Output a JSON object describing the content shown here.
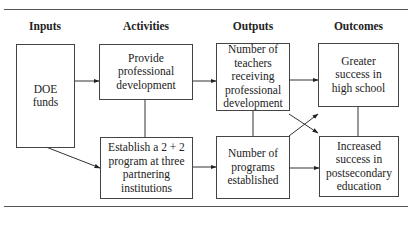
{
  "diagram": {
    "type": "logic-model",
    "columns": [
      {
        "id": "inputs",
        "label": "Inputs"
      },
      {
        "id": "activities",
        "label": "Activities"
      },
      {
        "id": "outputs",
        "label": "Outputs"
      },
      {
        "id": "outcomes",
        "label": "Outcomes"
      }
    ],
    "nodes": {
      "doe_funds": "DOE funds",
      "provide_pd": "Provide professional development",
      "establish_program": "Establish a 2 + 2 program at three partnering institutions",
      "num_teachers": "Number of teachers receiving professional development",
      "num_programs": "Number of programs established",
      "greater_success": "Greater success in high school",
      "increased_success": "Increased success in postsecondary education"
    },
    "edges": [
      {
        "from": "doe_funds",
        "to": "provide_pd",
        "arrow": true
      },
      {
        "from": "doe_funds",
        "to": "establish_program",
        "arrow": true
      },
      {
        "from": "provide_pd",
        "to": "establish_program",
        "arrow": false
      },
      {
        "from": "provide_pd",
        "to": "num_teachers",
        "arrow": true
      },
      {
        "from": "establish_program",
        "to": "num_programs",
        "arrow": true
      },
      {
        "from": "num_teachers",
        "to": "num_programs",
        "arrow": false
      },
      {
        "from": "num_teachers",
        "to": "greater_success",
        "arrow": true
      },
      {
        "from": "num_teachers",
        "to": "increased_success",
        "arrow": true
      },
      {
        "from": "num_programs",
        "to": "greater_success",
        "arrow": true
      },
      {
        "from": "num_programs",
        "to": "increased_success",
        "arrow": true
      },
      {
        "from": "greater_success",
        "to": "increased_success",
        "arrow": false
      }
    ]
  }
}
